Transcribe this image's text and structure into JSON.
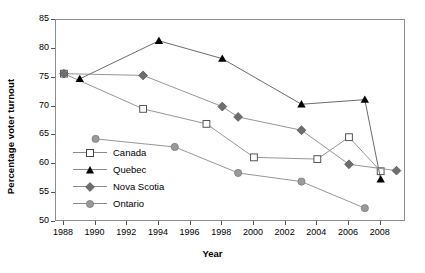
{
  "chart_data": {
    "type": "line",
    "title": "",
    "xlabel": "Year",
    "ylabel": "Percentage voter turnout",
    "xlim": [
      1987.5,
      2009.6
    ],
    "ylim": [
      50,
      85
    ],
    "yticks": [
      50,
      55,
      60,
      65,
      70,
      75,
      80,
      85
    ],
    "xticks": [
      1988,
      1990,
      1992,
      1994,
      1996,
      1998,
      2000,
      2002,
      2004,
      2006,
      2008
    ],
    "grid": false,
    "legend_position": "inside-lower-left",
    "series": [
      {
        "name": "Canada",
        "marker": "open-square",
        "color": "#8a8a8a",
        "points": [
          {
            "x": 1988,
            "y": 75.7
          },
          {
            "x": 1993,
            "y": 69.6
          },
          {
            "x": 1997,
            "y": 67.0
          },
          {
            "x": 2000,
            "y": 61.2
          },
          {
            "x": 2004,
            "y": 60.9
          },
          {
            "x": 2006,
            "y": 64.7
          },
          {
            "x": 2008,
            "y": 58.8
          }
        ]
      },
      {
        "name": "Quebec",
        "marker": "filled-triangle",
        "color": "#000000",
        "points": [
          {
            "x": 1989,
            "y": 74.8
          },
          {
            "x": 1994,
            "y": 81.4
          },
          {
            "x": 1998,
            "y": 78.3
          },
          {
            "x": 2003,
            "y": 70.4
          },
          {
            "x": 2007,
            "y": 71.2
          },
          {
            "x": 2008,
            "y": 57.4
          }
        ]
      },
      {
        "name": "Nova Scotia",
        "marker": "filled-diamond",
        "color": "#6e6e6e",
        "points": [
          {
            "x": 1988,
            "y": 75.7
          },
          {
            "x": 1993,
            "y": 75.4
          },
          {
            "x": 1998,
            "y": 70.0
          },
          {
            "x": 1999,
            "y": 68.2
          },
          {
            "x": 2003,
            "y": 65.9
          },
          {
            "x": 2006,
            "y": 60.0
          },
          {
            "x": 2009,
            "y": 58.9
          }
        ]
      },
      {
        "name": "Ontario",
        "marker": "filled-circle",
        "color": "#9a9a9a",
        "points": [
          {
            "x": 1990,
            "y": 64.4
          },
          {
            "x": 1995,
            "y": 63.0
          },
          {
            "x": 1999,
            "y": 58.5
          },
          {
            "x": 2003,
            "y": 57.0
          },
          {
            "x": 2007,
            "y": 52.4
          }
        ]
      }
    ]
  },
  "axes": {
    "ylabel": "Percentage voter turnout",
    "xlabel": "Year",
    "ytick_labels": [
      "85",
      "80",
      "75",
      "70",
      "65",
      "60",
      "55",
      "50"
    ],
    "xtick_labels": [
      "1988",
      "1990",
      "1992",
      "1994",
      "1996",
      "1998",
      "2000",
      "2002",
      "2004",
      "2006",
      "2008"
    ]
  },
  "legend": {
    "items": [
      {
        "label": "Canada"
      },
      {
        "label": "Quebec"
      },
      {
        "label": "Nova Scotia"
      },
      {
        "label": "Ontario"
      }
    ]
  },
  "colors": {
    "canada": "#8a8a8a",
    "quebec": "#000000",
    "nova_scotia": "#6e6e6e",
    "ontario": "#9a9a9a",
    "axis": "#8c8c8c"
  }
}
